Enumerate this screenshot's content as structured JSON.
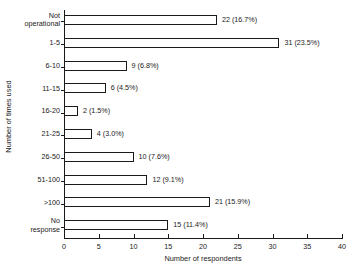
{
  "chart_data": {
    "type": "bar",
    "orientation": "horizontal",
    "title": "",
    "xlabel": "Number of respondents",
    "ylabel": "Number of times used",
    "xlim": [
      0,
      40
    ],
    "xticks": [
      0,
      5,
      10,
      15,
      20,
      25,
      30,
      35,
      40
    ],
    "grid": false,
    "legend": "none",
    "categories": [
      "Not\noperational",
      "1-5",
      "6-10",
      "11-15",
      "16-20",
      "21-25",
      "26-50",
      "51-100",
      ">100",
      "No\nresponse"
    ],
    "values": [
      22,
      31,
      9,
      6,
      2,
      4,
      10,
      12,
      21,
      15
    ],
    "percents": [
      "16.7%",
      "23.5%",
      "6.8%",
      "4.5%",
      "1.5%",
      "3.0%",
      "7.6%",
      "9.1%",
      "15.9%",
      "11.4%"
    ],
    "bar_labels": [
      "22  (16.7%)",
      "31  (23.5%)",
      "9  (6.8%)",
      "6  (4.5%)",
      "2  (1.5%)",
      "4  (3.0%)",
      "10  (7.6%)",
      "12  (9.1%)",
      "21  (15.9%)",
      "15  (11.4%)"
    ]
  }
}
